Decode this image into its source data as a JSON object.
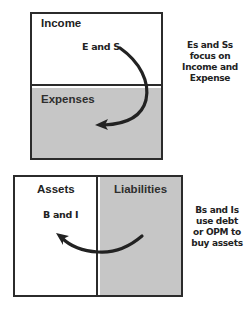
{
  "income_statement": {
    "top_label": "Income",
    "bottom_label": "Expenses",
    "arrow_label": "E and S",
    "note_lines": [
      "Es and Ss",
      "focus on",
      "Income and",
      "Expense"
    ]
  },
  "balance_sheet": {
    "left_label": "Assets",
    "right_label": "Liabilities",
    "arrow_label": "B and I",
    "note_lines": [
      "Bs and Is",
      "use debt",
      "or OPM to",
      "buy assets"
    ]
  },
  "colors": {
    "border": "#2b2b2b",
    "shaded": "#c6c6c6",
    "arrow": "#222222"
  }
}
